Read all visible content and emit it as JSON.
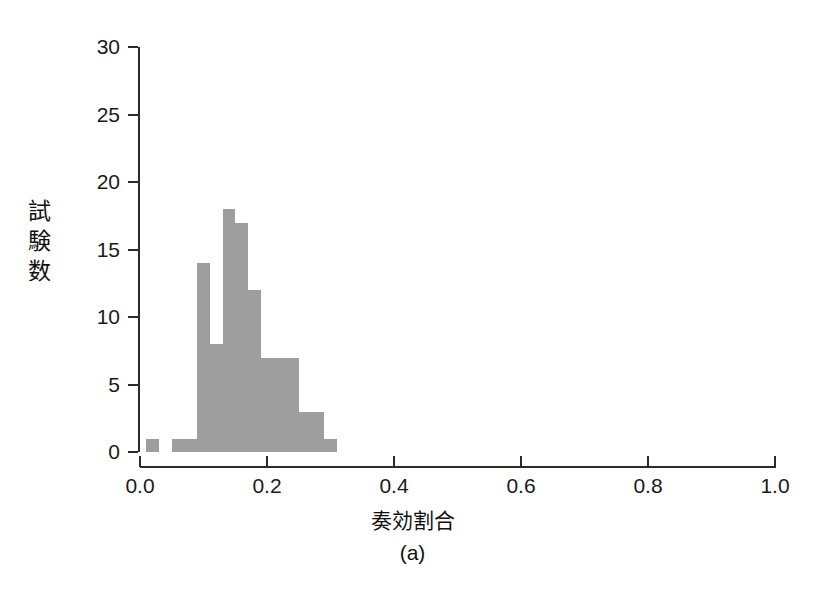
{
  "chart_data": {
    "type": "bar",
    "title": "",
    "subtitle": "",
    "xlabel": "奏効割合",
    "ylabel": "試験数",
    "caption": "(a)",
    "grid": false,
    "legend": null,
    "bar_color": "#9e9e9e",
    "axis_color": "#2b2b2b",
    "background": "#ffffff",
    "xlim": [
      0.0,
      1.0
    ],
    "ylim": [
      0,
      30
    ],
    "xticks": [
      "0.0",
      "0.2",
      "0.4",
      "0.6",
      "0.8",
      "1.0"
    ],
    "xtick_values": [
      0.0,
      0.2,
      0.4,
      0.6,
      0.8,
      1.0
    ],
    "yticks": [
      "0",
      "5",
      "10",
      "15",
      "20",
      "25",
      "30"
    ],
    "ytick_values": [
      0,
      5,
      10,
      15,
      20,
      25,
      30
    ],
    "bin_width": 0.02,
    "bins": [
      {
        "x0": 0.01,
        "x1": 0.03,
        "value": 1
      },
      {
        "x0": 0.05,
        "x1": 0.07,
        "value": 1
      },
      {
        "x0": 0.07,
        "x1": 0.09,
        "value": 1
      },
      {
        "x0": 0.09,
        "x1": 0.11,
        "value": 14
      },
      {
        "x0": 0.11,
        "x1": 0.13,
        "value": 8
      },
      {
        "x0": 0.13,
        "x1": 0.15,
        "value": 18
      },
      {
        "x0": 0.15,
        "x1": 0.17,
        "value": 17
      },
      {
        "x0": 0.17,
        "x1": 0.19,
        "value": 12
      },
      {
        "x0": 0.19,
        "x1": 0.21,
        "value": 7
      },
      {
        "x0": 0.21,
        "x1": 0.23,
        "value": 7
      },
      {
        "x0": 0.23,
        "x1": 0.25,
        "value": 7
      },
      {
        "x0": 0.25,
        "x1": 0.27,
        "value": 3
      },
      {
        "x0": 0.27,
        "x1": 0.29,
        "value": 3
      },
      {
        "x0": 0.29,
        "x1": 0.31,
        "value": 1
      }
    ],
    "categories": [
      "0.02",
      "0.06",
      "0.08",
      "0.10",
      "0.12",
      "0.14",
      "0.16",
      "0.18",
      "0.20",
      "0.22",
      "0.24",
      "0.26",
      "0.28",
      "0.30"
    ],
    "values": [
      1,
      1,
      1,
      14,
      8,
      18,
      17,
      12,
      7,
      7,
      7,
      3,
      3,
      1
    ]
  }
}
